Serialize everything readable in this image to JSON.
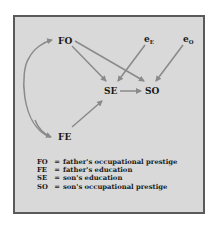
{
  "diagram": {
    "type": "path_diagram",
    "nodes": [
      {
        "id": "FO",
        "label": "FO"
      },
      {
        "id": "FE",
        "label": "FE"
      },
      {
        "id": "SE",
        "label": "SE"
      },
      {
        "id": "SO",
        "label": "SO"
      },
      {
        "id": "eE",
        "label": "e",
        "subscript": "E"
      },
      {
        "id": "eO",
        "label": "e",
        "subscript": "O"
      }
    ],
    "edges": [
      {
        "from": "FO",
        "to": "SE",
        "type": "directed"
      },
      {
        "from": "FO",
        "to": "SO",
        "type": "directed"
      },
      {
        "from": "FE",
        "to": "SE",
        "type": "directed"
      },
      {
        "from": "SE",
        "to": "SO",
        "type": "directed"
      },
      {
        "from": "eE",
        "to": "SE",
        "type": "directed"
      },
      {
        "from": "eO",
        "to": "SO",
        "type": "directed"
      },
      {
        "from": "FE",
        "to": "FO",
        "type": "curved_bidirectional"
      }
    ],
    "colors": {
      "background": "#d9d9d9",
      "border": "#5a5a5a",
      "arrow": "#8a8a8a",
      "text": "#1a1a1a"
    }
  },
  "legend": [
    {
      "abbr": "FO",
      "eq": "=",
      "meaning": "father's occupational prestige"
    },
    {
      "abbr": "FE",
      "eq": "=",
      "meaning": "father's education"
    },
    {
      "abbr": "SE",
      "eq": "=",
      "meaning": "son's education"
    },
    {
      "abbr": "SO",
      "eq": "=",
      "meaning": "son's occupational prestige"
    }
  ]
}
